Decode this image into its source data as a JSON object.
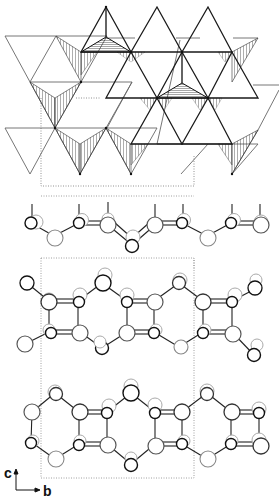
{
  "figure": {
    "type": "crystal-structure",
    "panels": [
      {
        "id": "polyhedral-view",
        "description": "tetrahedral layer (polyhedral representation)"
      },
      {
        "id": "single-chain-view",
        "description": "single corrugated chain of atoms"
      },
      {
        "id": "double-layer-view-1",
        "description": "ring layer with 4- and 6-membered rings"
      },
      {
        "id": "double-layer-view-2",
        "description": "ring layer with 4- and 6-membered rings"
      }
    ],
    "axes": {
      "vertical_label": "c",
      "horizontal_label": "b"
    },
    "colors": {
      "line": "#1a1a1a",
      "thin_line": "#555555",
      "faint_line": "#9a9a9a",
      "unit_cell": "#777777",
      "shade": "#444444",
      "background": "#ffffff"
    },
    "unit_cells": [
      {
        "x": 41,
        "y": 98,
        "w": 153,
        "h": 88
      },
      {
        "x": 41,
        "y": 255,
        "w": 153,
        "h": 0,
        "open_top": true
      },
      {
        "x": 41,
        "y": 258,
        "w": 153,
        "h": 220
      }
    ]
  }
}
